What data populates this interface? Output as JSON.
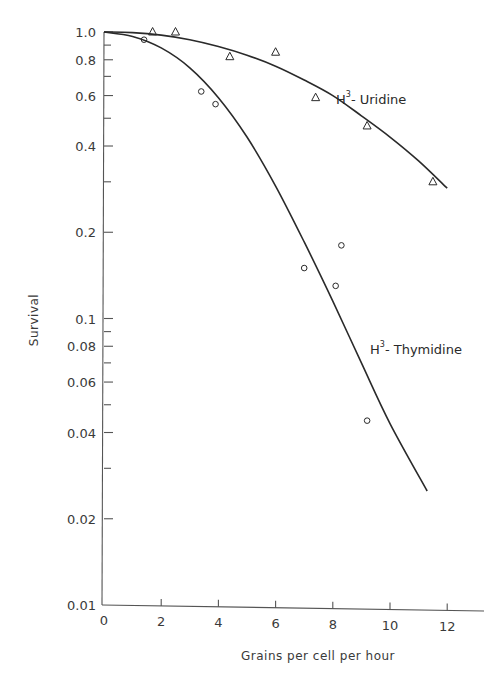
{
  "chart_data": {
    "type": "scatter",
    "title": "",
    "xlabel": "Grains per cell per hour",
    "ylabel": "Survival",
    "xlim": [
      0,
      13
    ],
    "ylim": [
      0.01,
      1.0
    ],
    "yscale": "log",
    "grid": false,
    "x_ticks": [
      0,
      2,
      4,
      6,
      8,
      10,
      12
    ],
    "x_tick_labels": [
      "0",
      "2",
      "4",
      "6",
      "8",
      "10",
      "12"
    ],
    "y_ticks_labeled": [
      1.0,
      0.8,
      0.6,
      0.4,
      0.2,
      0.1,
      0.08,
      0.06,
      0.04,
      0.02,
      0.01
    ],
    "y_tick_labels": [
      "1.0",
      "0.8",
      "0.6",
      "0.4",
      "0.2",
      "0.1",
      "0.08",
      "0.06",
      "0.04",
      "0.02",
      "0.01"
    ],
    "y_ticks_minor": [
      0.9,
      0.7,
      0.5,
      0.3,
      0.09,
      0.07,
      0.05,
      0.03
    ],
    "series": [
      {
        "name": "H3-Uridine",
        "label_main": "H",
        "label_sup": "3",
        "label_rest": "- Uridine",
        "marker": "triangle",
        "x": [
          1.7,
          2.5,
          4.4,
          6.0,
          7.4,
          9.2,
          11.5
        ],
        "y": [
          1.0,
          1.0,
          0.82,
          0.85,
          0.59,
          0.47,
          0.3
        ],
        "fit_curve": {
          "x": [
            0,
            1,
            2,
            3,
            4,
            5,
            6,
            7,
            8,
            9,
            10,
            11,
            12
          ],
          "y": [
            1.0,
            0.995,
            0.975,
            0.94,
            0.89,
            0.83,
            0.76,
            0.68,
            0.6,
            0.51,
            0.43,
            0.355,
            0.285
          ]
        }
      },
      {
        "name": "H3-Thymidine",
        "label_main": "H",
        "label_sup": "3",
        "label_rest": "- Thymidine",
        "marker": "circle",
        "x": [
          1.4,
          3.4,
          3.9,
          7.0,
          8.1,
          8.3,
          9.2
        ],
        "y": [
          0.94,
          0.62,
          0.56,
          0.15,
          0.13,
          0.18,
          0.044
        ],
        "fit_curve": {
          "x": [
            0,
            1,
            2,
            3,
            4,
            5,
            6,
            7,
            8,
            9,
            10,
            11.3
          ],
          "y": [
            1.0,
            0.965,
            0.88,
            0.75,
            0.59,
            0.43,
            0.29,
            0.185,
            0.115,
            0.07,
            0.043,
            0.025
          ]
        }
      }
    ]
  },
  "layout": {
    "plot_left": 104,
    "plot_bottom": 605,
    "x_px_per_unit": 28.6,
    "y_top_px": 32,
    "y_bottom_px": 605,
    "x_axis_end_px": 484
  },
  "colors": {
    "ink": "#2a2a2a",
    "axis": "#555555",
    "background": "#ffffff"
  }
}
